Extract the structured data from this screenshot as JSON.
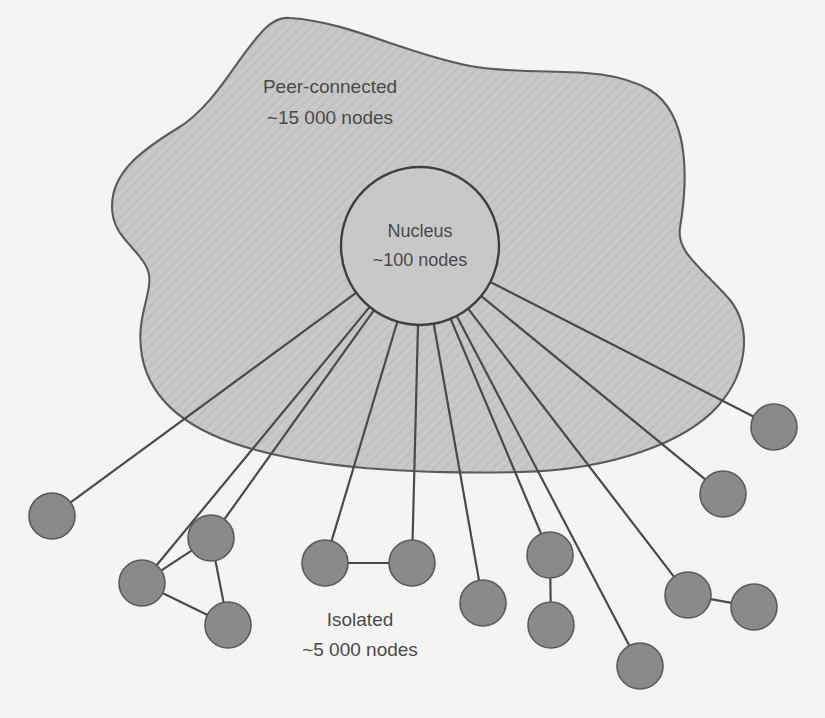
{
  "figure": {
    "type": "network-structure-diagram",
    "background_color": "#f5f4f2",
    "region_fill_color": "#c9c9c9",
    "region_stroke_color": "#5a5a5a",
    "node_fill_color": "#8a8a8a",
    "node_stroke_color": "#5a5a5a",
    "edge_color": "#4a4a4a",
    "text_color": "#4a4a4a"
  },
  "labels": {
    "peer_connected": {
      "line1": "Peer-connected",
      "line2": "~15 000 nodes",
      "x": 330,
      "y": 88
    },
    "nucleus": {
      "line1": "Nucleus",
      "line2": "~100 nodes",
      "x": 420,
      "y": 232
    },
    "isolated": {
      "line1": "Isolated",
      "line2": "~5 000 nodes",
      "x": 360,
      "y": 621
    }
  },
  "nucleus": {
    "label": "Nucleus",
    "count_text": "~100 nodes",
    "count": 100,
    "cx": 420,
    "cy": 246,
    "r": 79
  },
  "peer_connected_region": {
    "label": "Peer-connected",
    "count_text": "~15 000 nodes",
    "count": 15000,
    "path": "M 290 18 C 350 22 400 52 470 66 C 540 78 600 62 650 90 C 690 115 688 180 680 228 C 676 252 702 268 730 300 C 752 328 748 372 718 406 C 686 442 612 470 520 472 C 430 474 330 470 256 450 C 188 432 150 400 142 356 C 134 312 158 288 146 266 C 134 244 112 236 112 206 C 112 172 142 150 178 128 C 214 106 236 60 260 34 C 270 22 280 17 290 18 Z"
  },
  "isolated_region": {
    "label": "Isolated",
    "count_text": "~5 000 nodes",
    "count": 5000
  },
  "nodes": [
    {
      "id": "n1",
      "cx": 52,
      "cy": 516,
      "r": 23,
      "group": "left-lone"
    },
    {
      "id": "n2",
      "cx": 142,
      "cy": 583,
      "r": 23,
      "group": "triangle"
    },
    {
      "id": "n3",
      "cx": 211,
      "cy": 538,
      "r": 23,
      "group": "triangle"
    },
    {
      "id": "n4",
      "cx": 228,
      "cy": 625,
      "r": 23,
      "group": "triangle"
    },
    {
      "id": "n5",
      "cx": 325,
      "cy": 563,
      "r": 23,
      "group": "mid-pair"
    },
    {
      "id": "n6",
      "cx": 412,
      "cy": 563,
      "r": 23,
      "group": "mid-pair"
    },
    {
      "id": "n7",
      "cx": 483,
      "cy": 603,
      "r": 23,
      "group": "lone"
    },
    {
      "id": "n8",
      "cx": 550,
      "cy": 555,
      "r": 23,
      "group": "vert-pair"
    },
    {
      "id": "n9",
      "cx": 551,
      "cy": 625,
      "r": 23,
      "group": "vert-pair"
    },
    {
      "id": "n10",
      "cx": 640,
      "cy": 666,
      "r": 23,
      "group": "lone"
    },
    {
      "id": "n11",
      "cx": 688,
      "cy": 595,
      "r": 23,
      "group": "diag-pair"
    },
    {
      "id": "n12",
      "cx": 754,
      "cy": 607,
      "r": 23,
      "group": "diag-pair"
    },
    {
      "id": "n13",
      "cx": 723,
      "cy": 494,
      "r": 23,
      "group": "lone"
    },
    {
      "id": "n14",
      "cx": 774,
      "cy": 427,
      "r": 23,
      "group": "lone"
    }
  ],
  "spokes": [
    {
      "from": "nucleus",
      "to": "n1"
    },
    {
      "from": "nucleus",
      "to": "n2"
    },
    {
      "from": "nucleus",
      "to": "n3"
    },
    {
      "from": "nucleus",
      "to": "n5"
    },
    {
      "from": "nucleus",
      "to": "n6"
    },
    {
      "from": "nucleus",
      "to": "n7"
    },
    {
      "from": "nucleus",
      "to": "n8"
    },
    {
      "from": "nucleus",
      "to": "n10"
    },
    {
      "from": "nucleus",
      "to": "n11"
    },
    {
      "from": "nucleus",
      "to": "n13"
    },
    {
      "from": "nucleus",
      "to": "n14"
    }
  ],
  "peer_edges": [
    {
      "from": "n2",
      "to": "n3"
    },
    {
      "from": "n2",
      "to": "n4"
    },
    {
      "from": "n3",
      "to": "n4"
    },
    {
      "from": "n5",
      "to": "n6"
    },
    {
      "from": "n8",
      "to": "n9"
    },
    {
      "from": "n11",
      "to": "n12"
    }
  ]
}
